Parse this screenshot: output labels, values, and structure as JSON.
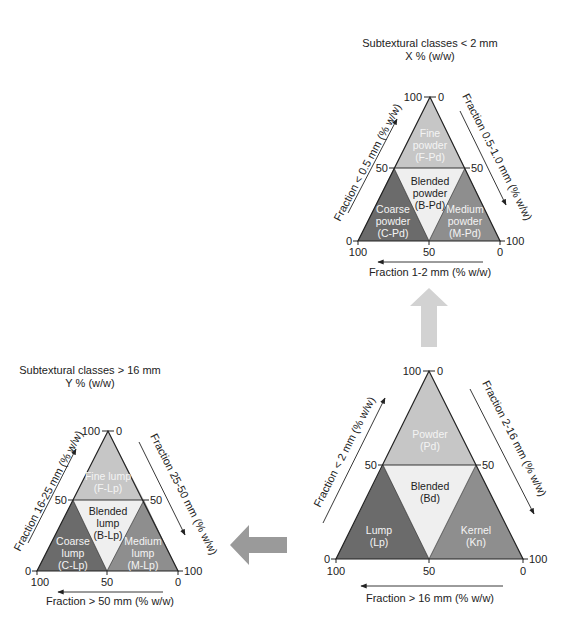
{
  "colors": {
    "light_region": "#c6c6c6",
    "blended_region": "#efefef",
    "dark_region": "#6b6b6b",
    "medium_region": "#8e8e8e",
    "flow_arrow": "#9a9a9a",
    "flow_arrow_light": "#d0d0d0",
    "outline": "#222222"
  },
  "triangles": {
    "main": {
      "title": "",
      "subtitle": "",
      "ticks": {
        "apex_left": "100",
        "apex_right": "0",
        "mid_left": "50",
        "mid_right": "50",
        "base_left_side": "0",
        "base_right_side": "100",
        "base_left": "100",
        "base_mid": "50",
        "base_right": "0"
      },
      "axes": {
        "left": "Fraction < 2 mm (% w/w)",
        "right": "Fraction 2-16 mm (% w/w)",
        "bottom": "Fraction > 16 mm (% w/w)"
      },
      "regions": {
        "top": {
          "name": "Powder",
          "code": "(Pd)"
        },
        "center": {
          "name": "Blended",
          "code": "(Bd)"
        },
        "left": {
          "name": "Lump",
          "code": "(Lp)"
        },
        "right": {
          "name": "Kernel",
          "code": "(Kn)"
        }
      }
    },
    "fine": {
      "title": "Subtextural classes < 2 mm",
      "subtitle": "X % (w/w)",
      "ticks": {
        "apex_left": "100",
        "apex_right": "0",
        "mid_left": "50",
        "mid_right": "50",
        "base_left_side": "0",
        "base_right_side": "100",
        "base_left": "100",
        "base_mid": "50",
        "base_right": "0"
      },
      "axes": {
        "left": "Fraction < 0.5 mm (% w/w)",
        "right": "Fraction 0.5-1.0 mm (% w/w)",
        "bottom": "Fraction 1-2 mm (% w/w)"
      },
      "regions": {
        "top": {
          "name": "Fine",
          "name2": "powder",
          "code": "(F-Pd)"
        },
        "center": {
          "name": "Blended",
          "name2": "powder",
          "code": "(B-Pd)"
        },
        "left": {
          "name": "Coarse",
          "name2": "powder",
          "code": "(C-Pd)"
        },
        "right": {
          "name": "Medium",
          "name2": "powder",
          "code": "(M-Pd)"
        }
      }
    },
    "coarse": {
      "title": "Subtextural classes > 16 mm",
      "subtitle": "Y % (w/w)",
      "ticks": {
        "apex_left": "100",
        "apex_right": "0",
        "mid_left": "50",
        "mid_right": "50",
        "base_left_side": "0",
        "base_right_side": "100",
        "base_left": "100",
        "base_mid": "50",
        "base_right": "0"
      },
      "axes": {
        "left": "Fraction 16-25 mm (% w/w)",
        "right": "Fraction 25-50 mm (% w/w)",
        "bottom": "Fraction > 50 mm (% w/w)"
      },
      "regions": {
        "top": {
          "name": "Fine lump",
          "code": "(F-Lp)"
        },
        "center": {
          "name": "Blended",
          "name2": "lump",
          "code": "(B-Lp)"
        },
        "left": {
          "name": "Coarse",
          "name2": "lump",
          "code": "(C-Lp)"
        },
        "right": {
          "name": "Medium",
          "name2": "lump",
          "code": "(M-Lp)"
        }
      }
    }
  }
}
